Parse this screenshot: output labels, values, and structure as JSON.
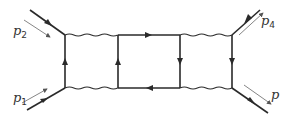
{
  "diagram": {
    "type": "feynman-diagram",
    "colors": {
      "line": "#2a2a2a",
      "momentum_arrow": "#555555",
      "background": "#ffffff"
    },
    "external_legs": [
      {
        "id": "p1",
        "label": "p",
        "subscript": "1",
        "position": "bottom-left",
        "direction": "incoming"
      },
      {
        "id": "p2",
        "label": "p",
        "subscript": "2",
        "position": "top-left",
        "direction": "incoming"
      },
      {
        "id": "p4",
        "label": "p",
        "subscript": "4",
        "position": "top-right",
        "direction": "incoming"
      },
      {
        "id": "p3",
        "label": "p",
        "subscript": "",
        "position": "bottom-right",
        "direction": "outgoing"
      }
    ],
    "internal_lines": [
      {
        "from": "left-top",
        "to": "col2-top",
        "style": "wavy"
      },
      {
        "from": "left-bottom",
        "to": "col2-bottom",
        "style": "wavy"
      },
      {
        "from": "left-bottom",
        "to": "left-top",
        "style": "fermion",
        "arrow": "up"
      },
      {
        "from": "col2-bottom",
        "to": "col2-top",
        "style": "fermion",
        "arrow": "up"
      },
      {
        "from": "col2-top",
        "to": "col3-top",
        "style": "fermion",
        "arrow": "right"
      },
      {
        "from": "col3-bottom",
        "to": "col2-bottom",
        "style": "fermion",
        "arrow": "left"
      },
      {
        "from": "col3-top",
        "to": "col3-bottom",
        "style": "fermion",
        "arrow": "down"
      },
      {
        "from": "col3-top",
        "to": "right-top",
        "style": "wavy"
      },
      {
        "from": "col3-bottom",
        "to": "right-bottom",
        "style": "wavy"
      },
      {
        "from": "right-top",
        "to": "right-bottom",
        "style": "fermion",
        "arrow": "down"
      }
    ]
  }
}
